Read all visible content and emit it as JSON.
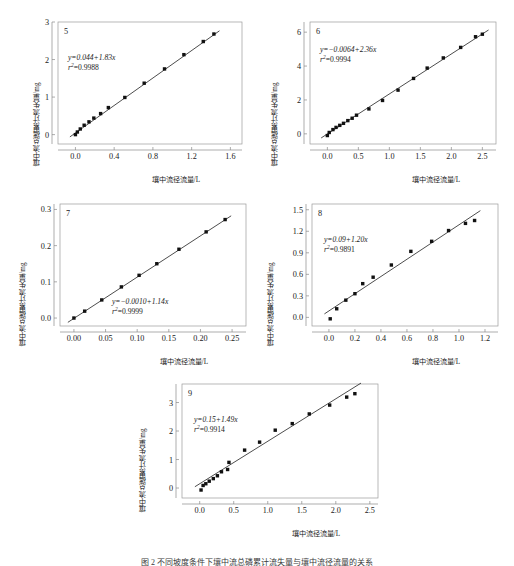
{
  "figure": {
    "caption": "图 2  不同坡度条件下壤中流总磷累计流失量与壤中流径流量的关系",
    "axis_labels": {
      "x": "壤中流径流量/L",
      "y": "壤中流总磷累计流失量/mg"
    }
  },
  "chart_data": [
    {
      "type": "scatter",
      "title": "5",
      "panel_number": "5",
      "equation": "y=0.044+1.83x",
      "r2_label": "r",
      "r2_exp": "2",
      "r2_value": "=0.9988",
      "slope": 1.83,
      "intercept": 0.044,
      "r_squared": 0.9988,
      "xlabel": "壤中流径流量/L",
      "ylabel": "壤中流总磷累计流失量/mg",
      "xlim": [
        -0.18,
        1.72
      ],
      "ylim": [
        -0.25,
        3.0
      ],
      "xticks": [
        "0.0",
        "0.4",
        "0.8",
        "1.2",
        "1.6"
      ],
      "xtick_values": [
        0.0,
        0.4,
        0.8,
        1.2,
        1.6
      ],
      "yticks": [
        "0",
        "1",
        "2",
        "3"
      ],
      "ytick_values": [
        0,
        1,
        2,
        3
      ],
      "grid": false,
      "x": [
        0.0,
        0.02,
        0.05,
        0.09,
        0.14,
        0.19,
        0.26,
        0.34,
        0.51,
        0.71,
        0.92,
        1.12,
        1.32,
        1.43
      ],
      "y": [
        0.0,
        0.07,
        0.15,
        0.25,
        0.34,
        0.44,
        0.56,
        0.72,
        0.99,
        1.37,
        1.75,
        2.13,
        2.48,
        2.68
      ]
    },
    {
      "type": "scatter",
      "title": "6",
      "panel_number": "6",
      "equation": "y=−0.0064+2.36x",
      "r2_label": "r",
      "r2_exp": "2",
      "r2_value": "=0.9994",
      "slope": 2.36,
      "intercept": -0.0064,
      "r_squared": 0.9994,
      "xlabel": "壤中流径流量/L",
      "ylabel": "壤中流总磷累计流失量/mg",
      "xlim": [
        -0.28,
        2.72
      ],
      "ylim": [
        -0.6,
        6.6
      ],
      "xticks": [
        "0.0",
        "0.5",
        "1.0",
        "1.5",
        "2.0",
        "2.5"
      ],
      "xtick_values": [
        0.0,
        0.5,
        1.0,
        1.5,
        2.0,
        2.5
      ],
      "yticks": [
        "0",
        "2",
        "4",
        "6"
      ],
      "ytick_values": [
        0,
        2,
        4,
        6
      ],
      "grid": false,
      "x": [
        0.0,
        0.03,
        0.09,
        0.14,
        0.2,
        0.26,
        0.33,
        0.4,
        0.47,
        0.67,
        0.89,
        1.14,
        1.39,
        1.61,
        1.87,
        2.15,
        2.39,
        2.5
      ],
      "y": [
        -0.1,
        0.08,
        0.25,
        0.38,
        0.5,
        0.62,
        0.78,
        0.92,
        1.1,
        1.47,
        1.97,
        2.58,
        3.27,
        3.88,
        4.48,
        5.1,
        5.73,
        5.88
      ]
    },
    {
      "type": "scatter",
      "title": "7",
      "panel_number": "7",
      "equation": "y=−0.0010+1.14x",
      "r2_label": "r",
      "r2_exp": "2",
      "r2_value": "=0.9999",
      "slope": 1.14,
      "intercept": -0.001,
      "r_squared": 0.9999,
      "xlabel": "壤中流径流量/L",
      "ylabel": "壤中流总磷累计流失量/mg",
      "xlim": [
        -0.022,
        0.272
      ],
      "ylim": [
        -0.022,
        0.315
      ],
      "xticks": [
        "0.00",
        "0.05",
        "0.10",
        "0.15",
        "0.20",
        "0.25"
      ],
      "xtick_values": [
        0.0,
        0.05,
        0.1,
        0.15,
        0.2,
        0.25
      ],
      "yticks": [
        "0.0",
        "0.1",
        "0.2",
        "0.3"
      ],
      "ytick_values": [
        0.0,
        0.1,
        0.2,
        0.3
      ],
      "grid": false,
      "x": [
        0.0,
        0.017,
        0.044,
        0.075,
        0.103,
        0.131,
        0.166,
        0.209,
        0.239
      ],
      "y": [
        0.0,
        0.019,
        0.05,
        0.086,
        0.118,
        0.15,
        0.19,
        0.238,
        0.272
      ]
    },
    {
      "type": "scatter",
      "title": "8",
      "panel_number": "8",
      "equation": "y=0.09+1.20x",
      "r2_label": "r",
      "r2_exp": "2",
      "r2_value": "=0.9891",
      "slope": 1.2,
      "intercept": 0.09,
      "r_squared": 0.9891,
      "xlabel": "壤中流径流量/L",
      "ylabel": "壤中流总磷累计流失量/mg",
      "xlim": [
        -0.13,
        1.3
      ],
      "ylim": [
        -0.12,
        1.58
      ],
      "xticks": [
        "0.0",
        "0.2",
        "0.4",
        "0.6",
        "0.8",
        "1.0",
        "1.2"
      ],
      "xtick_values": [
        0.0,
        0.2,
        0.4,
        0.6,
        0.8,
        1.0,
        1.2
      ],
      "yticks": [
        "0.0",
        "0.3",
        "0.6",
        "0.9",
        "1.2",
        "1.5"
      ],
      "ytick_values": [
        0.0,
        0.3,
        0.6,
        0.9,
        1.2,
        1.5
      ],
      "grid": false,
      "x": [
        0.01,
        0.06,
        0.13,
        0.2,
        0.26,
        0.34,
        0.48,
        0.63,
        0.79,
        0.92,
        1.05,
        1.12
      ],
      "y": [
        -0.02,
        0.12,
        0.24,
        0.33,
        0.47,
        0.56,
        0.73,
        0.92,
        1.06,
        1.21,
        1.31,
        1.35
      ]
    },
    {
      "type": "scatter",
      "title": "9",
      "panel_number": "9",
      "equation": "y=0.15+1.49x",
      "r2_label": "r",
      "r2_exp": "2",
      "r2_value": "=0.9914",
      "slope": 1.49,
      "intercept": 0.15,
      "r_squared": 0.9914,
      "xlabel": "壤中流径流量/L",
      "ylabel": "壤中流总磷累计流失量/mg",
      "xlim": [
        -0.26,
        2.62
      ],
      "ylim": [
        -0.35,
        3.65
      ],
      "xticks": [
        "0.0",
        "0.5",
        "1.0",
        "1.5",
        "2.0",
        "2.5"
      ],
      "xtick_values": [
        0.0,
        0.5,
        1.0,
        1.5,
        2.0,
        2.5
      ],
      "yticks": [
        "0",
        "1",
        "2",
        "3"
      ],
      "ytick_values": [
        0,
        1,
        2,
        3
      ],
      "grid": false,
      "x": [
        0.02,
        0.05,
        0.09,
        0.14,
        0.2,
        0.26,
        0.32,
        0.41,
        0.43,
        0.66,
        0.88,
        1.11,
        1.36,
        1.61,
        1.91,
        2.16,
        2.28
      ],
      "y": [
        -0.07,
        0.09,
        0.15,
        0.24,
        0.33,
        0.43,
        0.57,
        0.65,
        0.9,
        1.33,
        1.61,
        2.03,
        2.26,
        2.6,
        2.91,
        3.19,
        3.31
      ]
    }
  ]
}
